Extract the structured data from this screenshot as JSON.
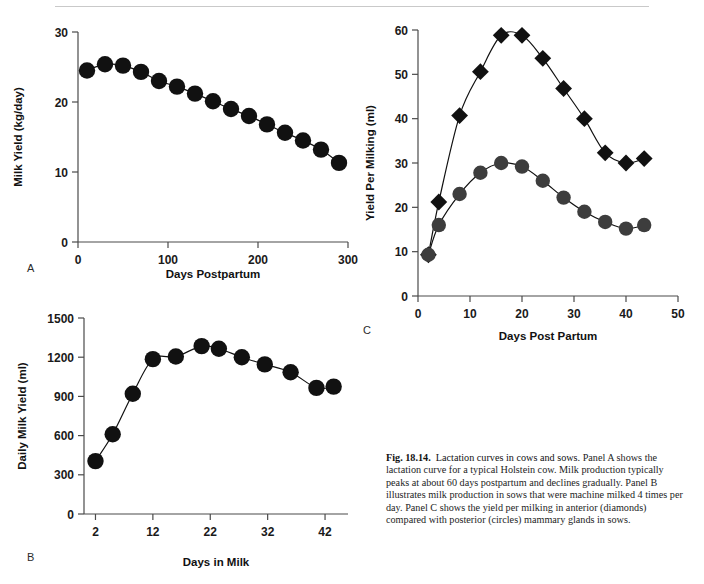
{
  "figure": {
    "caption_label": "Fig. 18.14.",
    "caption_title": "Lactation curves in cows and sows.",
    "caption_body": "Panel A shows the lactation curve for a typical Holstein cow. Milk production typically peaks at about 60 days postpartum and declines gradually. Panel B illustrates milk production in sows that were machine milked 4 times per day. Panel C shows the yield per milking in anterior (diamonds) compared with posterior (circles) mammary glands in sows.",
    "panel_labels": {
      "a": "A",
      "b": "B",
      "c": "C"
    },
    "colors": {
      "marker_black": "#111111",
      "marker_gray": "#3d3d3d",
      "axis": "#4a4a4a",
      "rule": "#c9c9c9"
    }
  },
  "chart_data": [
    {
      "id": "panel-a",
      "type": "scatter",
      "title": "",
      "xlabel": "Days Postpartum",
      "ylabel": "Milk Yield (kg/day)",
      "xlim": [
        0,
        300
      ],
      "ylim": [
        0,
        30
      ],
      "xticks": [
        0,
        100,
        200,
        300
      ],
      "yticks": [
        0,
        10,
        20,
        30
      ],
      "grid": false,
      "legend": "none",
      "marker": "circle",
      "marker_color": "#111111",
      "series": [
        {
          "name": "Holstein cow milk yield",
          "x": [
            10,
            30,
            50,
            70,
            90,
            110,
            130,
            150,
            170,
            190,
            210,
            230,
            250,
            270,
            290
          ],
          "y": [
            24.5,
            25.4,
            25.2,
            24.3,
            23.0,
            22.2,
            21.2,
            20.1,
            19.0,
            18.0,
            16.8,
            15.6,
            14.5,
            13.2,
            11.3
          ]
        }
      ]
    },
    {
      "id": "panel-b",
      "type": "scatter",
      "title": "",
      "xlabel": "Days in Milk",
      "ylabel": "Daily Milk Yield (ml)",
      "xlim": [
        0,
        46
      ],
      "ylim": [
        0,
        1500
      ],
      "xticks": [
        2,
        12,
        22,
        32,
        42
      ],
      "yticks": [
        0,
        300,
        600,
        900,
        1200,
        1500
      ],
      "grid": false,
      "legend": "none",
      "marker": "circle",
      "marker_color": "#111111",
      "series": [
        {
          "name": "Sow daily milk yield",
          "x": [
            2,
            5,
            8.5,
            12,
            16,
            20.5,
            23.5,
            27.5,
            31.5,
            36,
            40.5,
            43.5
          ],
          "y": [
            405,
            610,
            920,
            1185,
            1205,
            1285,
            1265,
            1200,
            1145,
            1085,
            965,
            975
          ]
        }
      ]
    },
    {
      "id": "panel-c",
      "type": "scatter",
      "title": "",
      "xlabel": "Days Post Partum",
      "ylabel": "Yield Per Milking (ml)",
      "xlim": [
        0,
        50
      ],
      "ylim": [
        0,
        60
      ],
      "xticks": [
        0,
        10,
        20,
        30,
        40,
        50
      ],
      "yticks": [
        0,
        10,
        20,
        30,
        40,
        50,
        60
      ],
      "grid": false,
      "legend": "none",
      "series": [
        {
          "name": "Anterior mammary glands (diamonds)",
          "marker": "diamond",
          "marker_color": "#111111",
          "x": [
            2,
            4,
            8,
            12,
            16,
            20,
            24,
            28,
            32,
            36,
            40,
            43.5
          ],
          "y": [
            9.3,
            21.2,
            40.7,
            50.6,
            58.8,
            58.8,
            53.6,
            46.8,
            40.0,
            32.3,
            30.0,
            31.0
          ]
        },
        {
          "name": "Posterior mammary glands (circles)",
          "marker": "circle",
          "marker_color": "#3d3d3d",
          "x": [
            2,
            4,
            8,
            12,
            16,
            20,
            24,
            28,
            32,
            36,
            40,
            43.5
          ],
          "y": [
            9.3,
            16.0,
            23.0,
            27.8,
            30.0,
            29.2,
            26.0,
            22.2,
            19.0,
            16.7,
            15.2,
            16.0
          ]
        }
      ]
    }
  ]
}
